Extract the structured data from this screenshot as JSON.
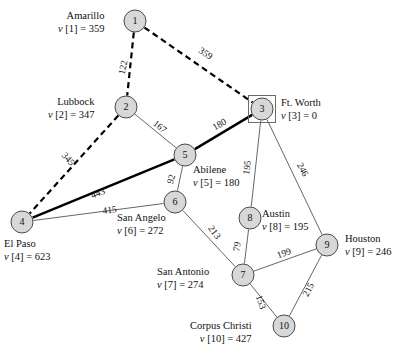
{
  "figure": {
    "type": "weighted-undirected-graph"
  },
  "nodes": [
    {
      "id": "1",
      "city": "Amarillo",
      "value_label": "v[1] = 359",
      "value": 359,
      "x": 135,
      "y": 21,
      "r": 11,
      "boxed": false,
      "label_align": "right",
      "label_x": 58,
      "label_y": 9
    },
    {
      "id": "2",
      "city": "Lubbock",
      "value_label": "v[2] = 347",
      "value": 347,
      "x": 126,
      "y": 107,
      "r": 11,
      "boxed": false,
      "label_align": "right",
      "label_x": 48,
      "label_y": 95
    },
    {
      "id": "3",
      "city": "Ft. Worth",
      "value_label": "v[3] = 0",
      "value": 0,
      "x": 262,
      "y": 109,
      "r": 11,
      "boxed": true,
      "label_align": "left",
      "label_x": 281,
      "label_y": 96
    },
    {
      "id": "4",
      "city": "El Paso",
      "value_label": "v[4] = 623",
      "value": 623,
      "x": 22,
      "y": 222,
      "r": 11,
      "boxed": false,
      "label_align": "left",
      "label_x": 4,
      "label_y": 237
    },
    {
      "id": "5",
      "city": "Abilene",
      "value_label": "v[5] = 180",
      "value": 180,
      "x": 185,
      "y": 155,
      "r": 11,
      "boxed": false,
      "label_align": "left",
      "label_x": 193,
      "label_y": 163
    },
    {
      "id": "6",
      "city": "San Angelo",
      "value_label": "v[6] = 272",
      "value": 272,
      "x": 175,
      "y": 202,
      "r": 11,
      "boxed": false,
      "label_align": "left",
      "label_x": 117,
      "label_y": 211
    },
    {
      "id": "7",
      "city": "San Antonio",
      "value_label": "v[7] = 274",
      "value": 274,
      "x": 243,
      "y": 275,
      "r": 11,
      "boxed": false,
      "label_align": "left",
      "label_x": 157,
      "label_y": 265
    },
    {
      "id": "8",
      "city": "Austin",
      "value_label": "v[8] = 195",
      "value": 195,
      "x": 250,
      "y": 218,
      "r": 11,
      "boxed": false,
      "label_align": "left",
      "label_x": 262,
      "label_y": 207
    },
    {
      "id": "9",
      "city": "Houston",
      "value_label": "v[9] = 246",
      "value": 246,
      "x": 327,
      "y": 245,
      "r": 11,
      "boxed": false,
      "label_align": "left",
      "label_x": 345,
      "label_y": 232
    },
    {
      "id": "10",
      "city": "Corpus Christi",
      "value_label": "v[10] = 427",
      "value": 427,
      "x": 284,
      "y": 326,
      "r": 11,
      "boxed": false,
      "label_align": "right",
      "label_x": 190,
      "label_y": 319
    }
  ],
  "edges": [
    {
      "from": "1",
      "to": "2",
      "weight": "122",
      "style": "dashed",
      "lx": 126,
      "ly": 68,
      "rot": -78
    },
    {
      "from": "1",
      "to": "3",
      "weight": "359",
      "style": "dashed",
      "lx": 204,
      "ly": 56,
      "rot": 33
    },
    {
      "from": "2",
      "to": "5",
      "weight": "167",
      "style": "thin",
      "lx": 158,
      "ly": 129,
      "rot": 38
    },
    {
      "from": "2",
      "to": "4",
      "weight": "345",
      "style": "dashed",
      "lx": 66,
      "ly": 161,
      "rot": 48
    },
    {
      "from": "3",
      "to": "5",
      "weight": "180",
      "style": "thick",
      "lx": 221,
      "ly": 127,
      "rot": -30
    },
    {
      "from": "3",
      "to": "8",
      "weight": "195",
      "style": "thin",
      "lx": 250,
      "ly": 168,
      "rot": -82
    },
    {
      "from": "3",
      "to": "9",
      "weight": "246",
      "style": "thin",
      "lx": 300,
      "ly": 171,
      "rot": 62
    },
    {
      "from": "4",
      "to": "5",
      "weight": "443",
      "style": "thick",
      "lx": 99,
      "ly": 196,
      "rot": -20
    },
    {
      "from": "4",
      "to": "6",
      "weight": "415",
      "style": "thin",
      "lx": 110,
      "ly": 213,
      "rot": -8
    },
    {
      "from": "5",
      "to": "6",
      "weight": "92",
      "style": "thin",
      "lx": 174,
      "ly": 180,
      "rot": -74
    },
    {
      "from": "6",
      "to": "7",
      "weight": "213",
      "style": "thin",
      "lx": 212,
      "ly": 234,
      "rot": 54
    },
    {
      "from": "7",
      "to": "8",
      "weight": "79",
      "style": "thin",
      "lx": 240,
      "ly": 247,
      "rot": -81
    },
    {
      "from": "7",
      "to": "9",
      "weight": "199",
      "style": "thin",
      "lx": 285,
      "ly": 256,
      "rot": -20
    },
    {
      "from": "7",
      "to": "10",
      "weight": "153",
      "style": "thin",
      "lx": 258,
      "ly": 303,
      "rot": 72
    },
    {
      "from": "9",
      "to": "10",
      "weight": "215",
      "style": "thin",
      "lx": 311,
      "ly": 291,
      "rot": -62
    }
  ],
  "colors": {
    "node_fill": "#d8d8d8",
    "node_stroke": "#4a4a4a",
    "edge_thin": "#555555",
    "edge_bold": "#000000",
    "background": "#ffffff"
  }
}
